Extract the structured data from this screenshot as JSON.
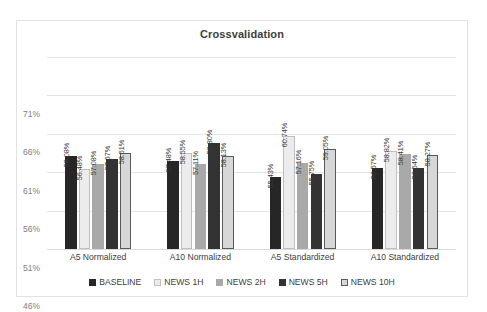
{
  "chart_data": {
    "type": "bar",
    "title": "Crossvalidation",
    "xlabel": "",
    "ylabel": "",
    "ylim": [
      46,
      71
    ],
    "yticks": [
      "46%",
      "51%",
      "56%",
      "61%",
      "66%",
      "71%"
    ],
    "ytick_values": [
      46,
      51,
      56,
      61,
      66,
      71
    ],
    "grid": true,
    "legend_position": "bottom",
    "value_suffix": "%",
    "categories": [
      "A5 Normalized",
      "A10 Normalized",
      "A5 Standardized",
      "A10 Standardized"
    ],
    "series": [
      {
        "name": "BASELINE",
        "color": "#262626",
        "border": "#262626",
        "values": [
          58.08,
          57.48,
          55.43,
          56.57
        ],
        "labels": [
          "58.08%",
          "57.48%",
          "55.43%",
          "56.57%"
        ]
      },
      {
        "name": "NEWS 1H",
        "color": "#ececed",
        "border": "#bfbfbf",
        "values": [
          56.48,
          58.55,
          60.74,
          58.82
        ],
        "labels": [
          "56.48%",
          "58.55%",
          "60.74%",
          "58.82%"
        ]
      },
      {
        "name": "NEWS 2H",
        "color": "#a9a9a9",
        "border": "#a9a9a9",
        "values": [
          57.08,
          57.11,
          57.16,
          58.41
        ],
        "labels": [
          "57.08%",
          "57.11%",
          "57.16%",
          "58.41%"
        ]
      },
      {
        "name": "NEWS 5H",
        "color": "#333333",
        "border": "#333333",
        "values": [
          57.67,
          59.8,
          55.75,
          56.54
        ],
        "labels": [
          "57.67%",
          "59.80%",
          "55.75%",
          "56.54%"
        ]
      },
      {
        "name": "NEWS 10H",
        "color": "#d7d7d7",
        "border": "#5a5a5a",
        "values": [
          58.51,
          58.13,
          59.05,
          58.27
        ],
        "labels": [
          "58.51%",
          "58.13%",
          "59.05%",
          "58.27%"
        ]
      }
    ]
  }
}
